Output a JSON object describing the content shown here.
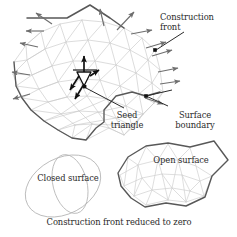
{
  "figure": {
    "title_caption": "Construction front reduced to zero",
    "background_color": "#ffffff",
    "mesh_color": "#c9c9c9",
    "boundary_color": "#585858",
    "arrow_color": "#6e6e6e",
    "seed_arrow_color": "#111111",
    "text_color": "#2b2b2b"
  },
  "labels": {
    "construction_front": "Construction\nfront",
    "construction_front_line1": "Construction",
    "construction_front_line2": "front",
    "seed_triangle_line1": "Seed",
    "seed_triangle_line2": "triangle",
    "surface_boundary_line1": "Surface",
    "surface_boundary_line2": "boundary",
    "closed_surface": "Closed surface",
    "open_surface": "Open surface",
    "caption": "Construction front reduced to zero"
  },
  "diagram_elements": {
    "main_surface": {
      "name": "partially-triangulated-surface",
      "description": "large triangulated mesh patch with advancing construction front"
    },
    "closed_surface": {
      "name": "closed-surface-sphere",
      "description": "two overlapping ellipses depicting a closed sphere"
    },
    "open_surface": {
      "name": "open-surface-patch",
      "description": "triangulated polygonal patch with dark boundary"
    },
    "seed_triangle": {
      "name": "seed-triangle",
      "description": "small outlined triangle with bold black outward normals"
    },
    "markers": {
      "construction_front_dot": "filled square marker on construction front",
      "surface_boundary_dot": "filled square marker on surface boundary"
    },
    "front_arrows_count": 14
  }
}
